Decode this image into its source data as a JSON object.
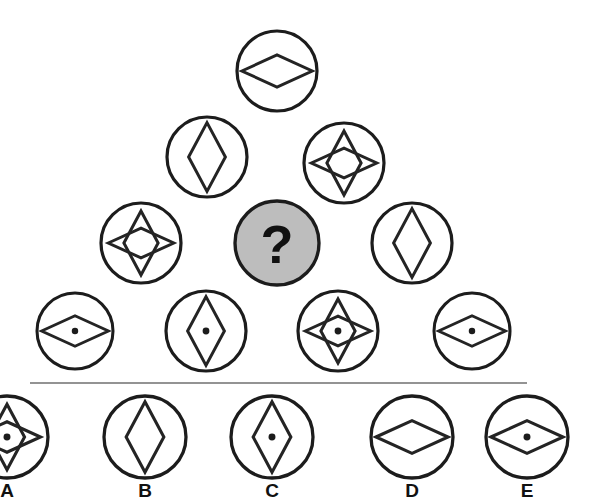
{
  "puzzle": {
    "type": "matrix-reasoning-figure",
    "background_color": "#ffffff",
    "stroke_color": "#242424",
    "unknown_fill_color": "#bdbdbd",
    "unknown_marker": "?",
    "divider": {
      "x1": 30,
      "y1": 383,
      "x2": 527,
      "y2": 383
    },
    "rows": [
      {
        "row_index": 1,
        "cells": [
          {
            "id": "r1c1",
            "cx": 277,
            "cy": 71,
            "r": 40,
            "shape": "horizontal-diamond",
            "dot": false,
            "unknown": false
          }
        ]
      },
      {
        "row_index": 2,
        "cells": [
          {
            "id": "r2c1",
            "cx": 207,
            "cy": 157,
            "r": 40,
            "shape": "vertical-diamond",
            "dot": false,
            "unknown": false
          },
          {
            "id": "r2c2",
            "cx": 344,
            "cy": 163,
            "r": 40,
            "shape": "four-point-star",
            "dot": false,
            "unknown": false
          }
        ]
      },
      {
        "row_index": 3,
        "cells": [
          {
            "id": "r3c1",
            "cx": 141,
            "cy": 243,
            "r": 40,
            "shape": "four-point-star",
            "dot": false,
            "unknown": false
          },
          {
            "id": "r3c2",
            "cx": 277,
            "cy": 243,
            "r": 42,
            "shape": "unknown",
            "dot": false,
            "unknown": true
          },
          {
            "id": "r3c3",
            "cx": 412,
            "cy": 243,
            "r": 40,
            "shape": "vertical-diamond",
            "dot": false,
            "unknown": false
          }
        ]
      },
      {
        "row_index": 4,
        "cells": [
          {
            "id": "r4c1",
            "cx": 75,
            "cy": 331,
            "r": 38,
            "shape": "horizontal-diamond",
            "dot": true,
            "unknown": false
          },
          {
            "id": "r4c2",
            "cx": 206,
            "cy": 331,
            "r": 40,
            "shape": "vertical-diamond",
            "dot": true,
            "unknown": false
          },
          {
            "id": "r4c3",
            "cx": 338,
            "cy": 331,
            "r": 40,
            "shape": "four-point-star",
            "dot": true,
            "unknown": false
          },
          {
            "id": "r4c4",
            "cx": 472,
            "cy": 331,
            "r": 38,
            "shape": "horizontal-diamond",
            "dot": true,
            "unknown": false
          }
        ]
      }
    ],
    "options": [
      {
        "id": "option-a",
        "label": "A",
        "cx": 7,
        "cy": 437,
        "r": 41,
        "shape": "four-point-star",
        "dot": true,
        "clipped": true
      },
      {
        "id": "option-b",
        "label": "B",
        "cx": 145,
        "cy": 437,
        "r": 41,
        "shape": "vertical-diamond",
        "dot": false,
        "clipped": false
      },
      {
        "id": "option-c",
        "label": "C",
        "cx": 272,
        "cy": 437,
        "r": 41,
        "shape": "vertical-diamond",
        "dot": true,
        "clipped": false
      },
      {
        "id": "option-d",
        "label": "D",
        "cx": 412,
        "cy": 437,
        "r": 41,
        "shape": "horizontal-diamond",
        "dot": false,
        "clipped": false
      },
      {
        "id": "option-e",
        "label": "E",
        "cx": 527,
        "cy": 437,
        "r": 41,
        "shape": "horizontal-diamond",
        "dot": true,
        "clipped": false
      }
    ],
    "option_label_y": 497
  }
}
